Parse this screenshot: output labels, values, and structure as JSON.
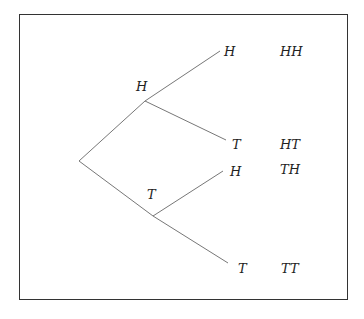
{
  "diagram": {
    "type": "probability-tree",
    "first_level": [
      {
        "label": "H",
        "children": [
          {
            "label": "H",
            "outcome": "HH"
          },
          {
            "label": "T",
            "outcome": "HT"
          }
        ]
      },
      {
        "label": "T",
        "children": [
          {
            "label": "H",
            "outcome": "TH"
          },
          {
            "label": "T",
            "outcome": "TT"
          }
        ]
      }
    ],
    "line_color": "#777777"
  }
}
